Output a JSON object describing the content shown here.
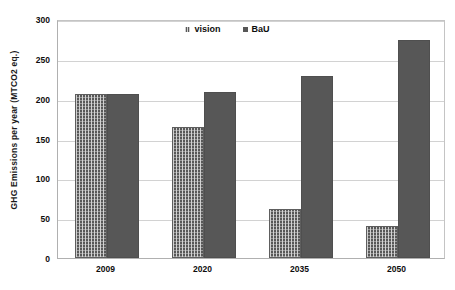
{
  "chart_data": {
    "type": "bar",
    "title": "",
    "subtitle": "",
    "xlabel": "",
    "ylabel": "GHG  Emissions per  year (MTCO2 eq.)",
    "categories": [
      "2009",
      "2020",
      "2035",
      "2050"
    ],
    "series": [
      {
        "name": "vision",
        "values": [
          206,
          165,
          61,
          40
        ],
        "color": "#585858",
        "pattern": "cross-hatch"
      },
      {
        "name": "BaU",
        "values": [
          206,
          209,
          229,
          274
        ],
        "color": "#575757",
        "pattern": "solid"
      }
    ],
    "ylim": [
      0,
      300
    ],
    "ytick_values": [
      0,
      50,
      100,
      150,
      200,
      250,
      300
    ],
    "ytick_labels": [
      "0",
      "50",
      "100",
      "150",
      "200",
      "250",
      "300"
    ],
    "grid": {
      "horizontal": true,
      "vertical": false
    },
    "legend": {
      "position": "top-center",
      "entries": [
        "vision",
        "BaU"
      ]
    },
    "annotations": []
  },
  "axes": {
    "y_title": "GHG  Emissions per  year (MTCO2 eq.)",
    "y_ticks": [
      "300",
      "250",
      "200",
      "150",
      "100",
      "50",
      "0"
    ],
    "x_ticks": [
      "2009",
      "2020",
      "2035",
      "2050"
    ]
  },
  "legend": {
    "items": [
      {
        "label": "vision",
        "series": "vision"
      },
      {
        "label": "BaU",
        "series": "bau"
      }
    ]
  }
}
